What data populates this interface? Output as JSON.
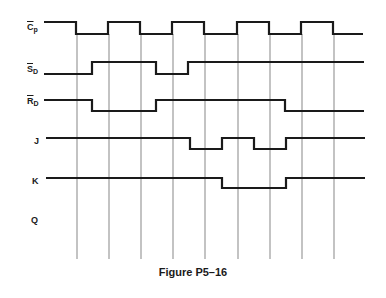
{
  "figure": {
    "caption": "Figure P5–16",
    "colors": {
      "waveform": "#1a1a1a",
      "gridline": "#555555",
      "background": "#ffffff"
    }
  },
  "signals": [
    {
      "id": "cp",
      "main": "C",
      "sub": "p",
      "overbar": true,
      "y_high": 22,
      "y_low": 34,
      "label_y": 28,
      "points": [
        [
          44,
          "H"
        ],
        [
          76,
          "L"
        ],
        [
          108,
          "H"
        ],
        [
          140,
          "L"
        ],
        [
          172,
          "H"
        ],
        [
          204,
          "L"
        ],
        [
          237,
          "H"
        ],
        [
          269,
          "L"
        ],
        [
          301,
          "H"
        ],
        [
          333,
          "L"
        ],
        [
          363,
          "L"
        ]
      ]
    },
    {
      "id": "sd",
      "main": "S",
      "sub": "D",
      "overbar": true,
      "y_high": 62,
      "y_low": 74,
      "label_y": 71,
      "points": [
        [
          44,
          "L"
        ],
        [
          92,
          "H"
        ],
        [
          156,
          "L"
        ],
        [
          188,
          "H"
        ],
        [
          364,
          "H"
        ]
      ]
    },
    {
      "id": "rd",
      "main": "R",
      "sub": "D",
      "overbar": true,
      "y_high": 100,
      "y_low": 111,
      "label_y": 102,
      "points": [
        [
          44,
          "H"
        ],
        [
          92,
          "L"
        ],
        [
          156,
          "H"
        ],
        [
          285,
          "L"
        ],
        [
          364,
          "L"
        ]
      ]
    },
    {
      "id": "j",
      "main": "J",
      "sub": "",
      "overbar": false,
      "y_high": 138,
      "y_low": 149,
      "label_y": 142,
      "points": [
        [
          46,
          "H"
        ],
        [
          190,
          "L"
        ],
        [
          222,
          "H"
        ],
        [
          254,
          "L"
        ],
        [
          286,
          "H"
        ],
        [
          365,
          "H"
        ]
      ]
    },
    {
      "id": "k",
      "main": "K",
      "sub": "",
      "overbar": false,
      "y_high": 178,
      "y_low": 188,
      "label_y": 182,
      "points": [
        [
          46,
          "H"
        ],
        [
          222,
          "L"
        ],
        [
          286,
          "H"
        ],
        [
          365,
          "H"
        ]
      ]
    },
    {
      "id": "q",
      "main": "Q",
      "sub": "",
      "overbar": false,
      "y_high": null,
      "y_low": null,
      "label_y": 221,
      "points": []
    }
  ],
  "gridlines": {
    "x": [
      77,
      109,
      141,
      173,
      205,
      238,
      270,
      302,
      334
    ],
    "y_top": 34,
    "y_bottom": 259
  },
  "labels": {
    "cp": {
      "main": "C",
      "sub": "p"
    },
    "sd": {
      "main": "S",
      "sub": "D"
    },
    "rd": {
      "main": "R",
      "sub": "D"
    },
    "j": {
      "main": "J"
    },
    "k": {
      "main": "K"
    },
    "q": {
      "main": "Q"
    }
  }
}
